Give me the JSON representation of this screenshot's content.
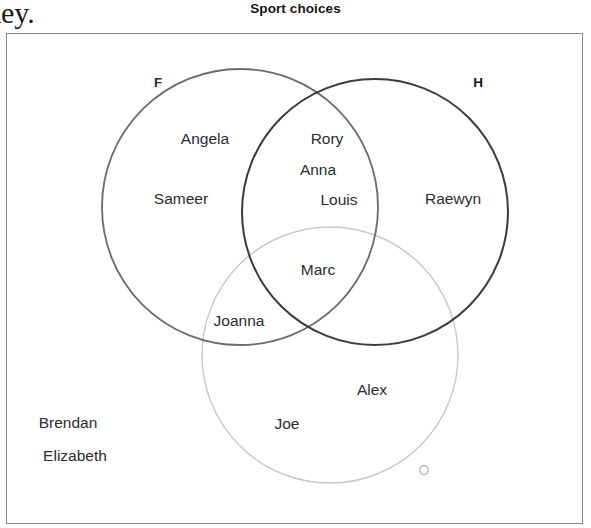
{
  "page": {
    "clipped_text": "key.",
    "title": "Sport choices"
  },
  "diagram": {
    "type": "venn-3-set",
    "universe_border_color": "#8a8a8e",
    "sets": [
      {
        "key": "F",
        "label": "F",
        "color": "#6b6b6b",
        "cx": 240,
        "cy": 207,
        "r": 138,
        "label_x": 158,
        "label_y": 82
      },
      {
        "key": "H",
        "label": "H",
        "color": "#3a3a42",
        "cx": 375,
        "cy": 212,
        "r": 133,
        "label_x": 478,
        "label_y": 82
      },
      {
        "key": "O",
        "label": "O",
        "color": "#c8c8c8",
        "cx": 330,
        "cy": 355,
        "r": 128,
        "label_x": 424,
        "label_y": 470
      }
    ],
    "regions": [
      {
        "id": "F-only",
        "members": [
          "Angela",
          "Sameer"
        ]
      },
      {
        "id": "H-only",
        "members": [
          "Raewyn"
        ]
      },
      {
        "id": "O-only",
        "members": [
          "Alex",
          "Joe"
        ]
      },
      {
        "id": "F-and-H",
        "members": [
          "Rory",
          "Anna",
          "Louis"
        ]
      },
      {
        "id": "F-and-O",
        "members": [
          "Joanna"
        ]
      },
      {
        "id": "F-H-O",
        "members": [
          "Marc"
        ]
      },
      {
        "id": "outside",
        "members": [
          "Brendan",
          "Elizabeth"
        ]
      }
    ],
    "labels": [
      {
        "text": "Angela",
        "x": 205,
        "y": 139,
        "region": "F-only"
      },
      {
        "text": "Sameer",
        "x": 181,
        "y": 199,
        "region": "F-only"
      },
      {
        "text": "Rory",
        "x": 327,
        "y": 139,
        "region": "F-and-H"
      },
      {
        "text": "Anna",
        "x": 318,
        "y": 170,
        "region": "F-and-H"
      },
      {
        "text": "Louis",
        "x": 339,
        "y": 200,
        "region": "F-and-H"
      },
      {
        "text": "Raewyn",
        "x": 453,
        "y": 199,
        "region": "H-only"
      },
      {
        "text": "Marc",
        "x": 318,
        "y": 270,
        "region": "F-H-O"
      },
      {
        "text": "Joanna",
        "x": 239,
        "y": 321,
        "region": "F-and-O"
      },
      {
        "text": "Alex",
        "x": 372,
        "y": 390,
        "region": "O-only"
      },
      {
        "text": "Joe",
        "x": 287,
        "y": 424,
        "region": "O-only"
      },
      {
        "text": "Brendan",
        "x": 68,
        "y": 423,
        "region": "outside"
      },
      {
        "text": "Elizabeth",
        "x": 75,
        "y": 456,
        "region": "outside"
      }
    ]
  }
}
